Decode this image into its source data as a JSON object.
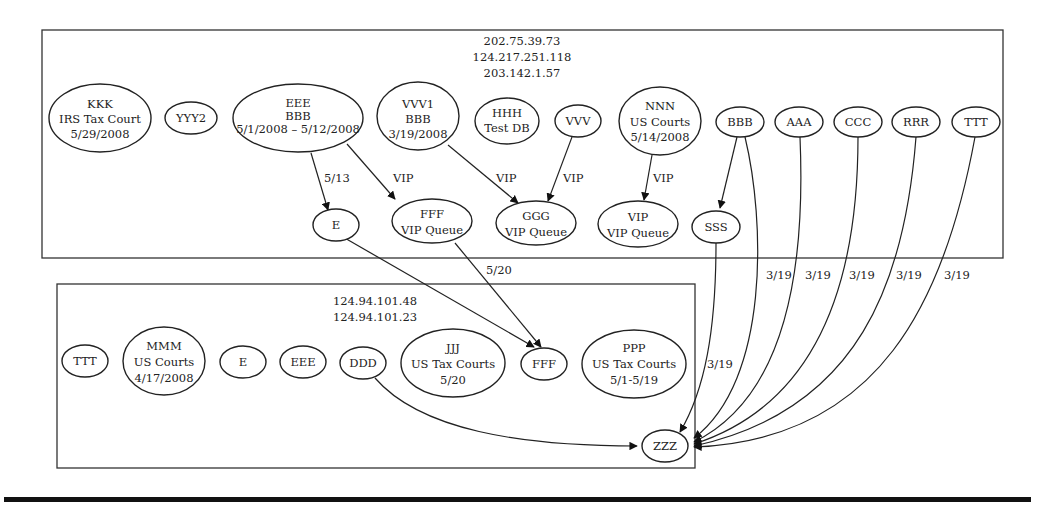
{
  "clusters": [
    {
      "id": "cluster-top",
      "ips": [
        "202.75.39.73",
        "124.217.251.118",
        "203.142.1.57"
      ]
    },
    {
      "id": "cluster-bottom",
      "ips": [
        "124.94.101.48",
        "124.94.101.23"
      ]
    }
  ],
  "nodes": {
    "kkk": [
      "KKK",
      "IRS Tax Court",
      "5/29/2008"
    ],
    "yyy2": [
      "YYY2"
    ],
    "eee_top": [
      "EEE",
      "BBB",
      "5/1/2008 – 5/12/2008"
    ],
    "vvv1": [
      "VVV1",
      "BBB",
      "3/19/2008"
    ],
    "hhh": [
      "HHH",
      "Test DB"
    ],
    "vvv": [
      "VVV"
    ],
    "nnn": [
      "NNN",
      "US Courts",
      "5/14/2008"
    ],
    "bbb": [
      "BBB"
    ],
    "aaa": [
      "AAA"
    ],
    "ccc": [
      "CCC"
    ],
    "rrr": [
      "RRR"
    ],
    "ttt_top": [
      "TTT"
    ],
    "e_top": [
      "E"
    ],
    "fff_vip": [
      "FFF",
      "VIP Queue"
    ],
    "ggg": [
      "GGG",
      "VIP Queue"
    ],
    "vip": [
      "VIP",
      "VIP Queue"
    ],
    "sss": [
      "SSS"
    ],
    "ttt_bottom": [
      "TTT"
    ],
    "mmm": [
      "MMM",
      "US Courts",
      "4/17/2008"
    ],
    "e_bottom": [
      "E"
    ],
    "eee_bottom": [
      "EEE"
    ],
    "ddd": [
      "DDD"
    ],
    "jjj": [
      "JJJ",
      "US Tax Courts",
      "5/20"
    ],
    "fff_bottom": [
      "FFF"
    ],
    "ppp": [
      "PPP",
      "US Tax Courts",
      "5/1-5/19"
    ],
    "zzz": [
      "ZZZ"
    ]
  },
  "edges": [
    {
      "from": "EEE/BBB",
      "to": "E",
      "label": "5/13"
    },
    {
      "from": "EEE/BBB",
      "to": "FFF VIP Queue",
      "label": "VIP"
    },
    {
      "from": "VVV1",
      "to": "GGG VIP Queue",
      "label": "VIP"
    },
    {
      "from": "VVV",
      "to": "GGG VIP Queue",
      "label": "VIP"
    },
    {
      "from": "NNN",
      "to": "VIP VIP Queue",
      "label": "VIP"
    },
    {
      "from": "BBB",
      "to": "SSS",
      "label": ""
    },
    {
      "from": "E",
      "to": "FFF",
      "label": ""
    },
    {
      "from": "FFF VIP Queue",
      "to": "FFF",
      "label": "5/20"
    },
    {
      "from": "SSS",
      "to": "ZZZ",
      "label": "3/19"
    },
    {
      "from": "BBB",
      "to": "ZZZ",
      "label": "3/19"
    },
    {
      "from": "AAA",
      "to": "ZZZ",
      "label": "3/19"
    },
    {
      "from": "CCC",
      "to": "ZZZ",
      "label": "3/19"
    },
    {
      "from": "RRR",
      "to": "ZZZ",
      "label": "3/19"
    },
    {
      "from": "TTT",
      "to": "ZZZ",
      "label": "3/19"
    },
    {
      "from": "DDD",
      "to": "ZZZ",
      "label": ""
    }
  ],
  "edge_labels": {
    "eee_e": "5/13",
    "eee_fff": "VIP",
    "vvv1_ggg": "VIP",
    "vvv_ggg": "VIP",
    "nnn_vip": "VIP",
    "fff_fff": "5/20",
    "sss_zzz": "3/19",
    "bbb_zzz": "3/19",
    "aaa_zzz": "3/19",
    "ccc_zzz": "3/19",
    "rrr_zzz": "3/19",
    "ttt_zzz": "3/19"
  }
}
